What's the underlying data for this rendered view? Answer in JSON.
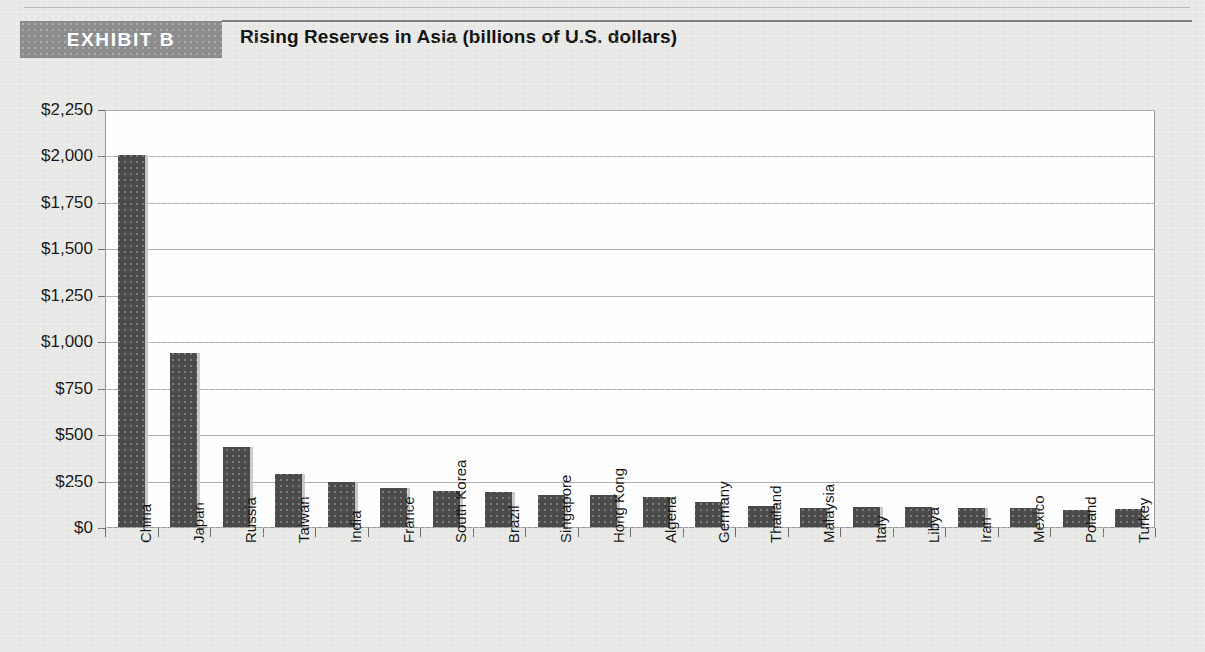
{
  "header": {
    "badge_label": "EXHIBIT B",
    "title": "Rising Reserves in Asia (billions of U.S. dollars)"
  },
  "chart_data": {
    "type": "bar",
    "title": "Rising Reserves in Asia (billions of U.S. dollars)",
    "xlabel": "",
    "ylabel": "",
    "ylim": [
      0,
      2250
    ],
    "ytick_values": [
      0,
      250,
      500,
      750,
      1000,
      1250,
      1500,
      1750,
      2000,
      2250
    ],
    "ytick_labels": [
      "$0",
      "$250",
      "$500",
      "$750",
      "$1,000",
      "$1,250",
      "$1,500",
      "$1,750",
      "$2,000",
      "$2,250"
    ],
    "grid": true,
    "legend": "none",
    "bar_color": "#4b4b4b",
    "categories": [
      "China",
      "Japan",
      "Russia",
      "Taiwan",
      "India",
      "France",
      "South Korea",
      "Brazil",
      "Singapore",
      "Hong Kong",
      "Algeria",
      "Germany",
      "Thailand",
      "Malaysia",
      "Italy",
      "Libya",
      "Iran",
      "Mexico",
      "Poland",
      "Turkey"
    ],
    "values": [
      2010,
      940,
      435,
      290,
      250,
      215,
      200,
      195,
      180,
      175,
      165,
      140,
      120,
      110,
      115,
      115,
      110,
      105,
      95,
      100
    ]
  }
}
